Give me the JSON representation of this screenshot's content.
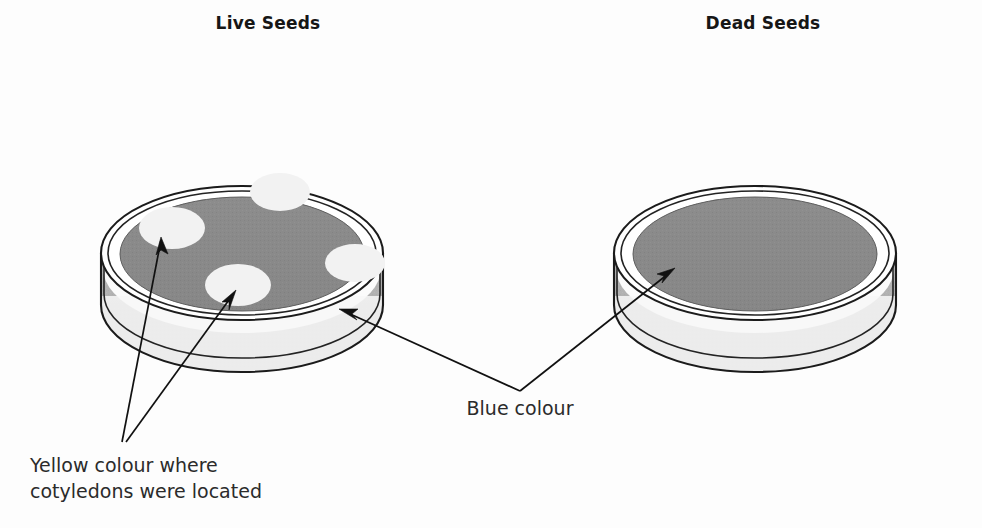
{
  "figure": {
    "background_color": "#fdfdfd"
  },
  "headings": [
    {
      "id": "live",
      "label": "Live Seeds",
      "x": 268,
      "y": 16
    },
    {
      "id": "dead",
      "label": "Dead Seeds",
      "x": 763,
      "y": 16
    }
  ],
  "callouts": [
    {
      "id": "yellow-callout",
      "lines": [
        "Yellow colour where",
        "cotyledons were located"
      ],
      "x": 30,
      "y": 472,
      "line_height": 26,
      "anchor": "start"
    },
    {
      "id": "blue-callout",
      "lines": [
        "Blue colour"
      ],
      "x": 520,
      "y": 415,
      "line_height": 26,
      "anchor": "middle"
    }
  ],
  "colors": {
    "medium_blue_gray": "#8a8a8a",
    "medium_blue_gray_shade": "#7e7e7e",
    "dish_wall_gray": "#b3b3b3",
    "dish_wall_gray_dark": "#a4a4a4",
    "dish_rim_white": "#fbfbfb",
    "cotyledon_yellow": "#f2f2f2",
    "cotyledon_yellow_edge": "#e8e8e8",
    "outline_black": "#1b1b1b",
    "text_dark": "#2b2b2b",
    "heading_dark": "#161616"
  },
  "dishes": [
    {
      "id": "live-seeds-dish",
      "name": "Live Seeds petri dish",
      "center_x": 242,
      "center_y": 253,
      "rim_rx": 141,
      "rim_ry": 67,
      "wall_height": 72,
      "medium_rx": 122,
      "medium_ry": 57,
      "medium_label": "blue colour medium",
      "spots": [
        {
          "id": "spot-top",
          "cx": 280,
          "cy": 192,
          "rx": 30,
          "ry": 19
        },
        {
          "id": "spot-left",
          "cx": 172,
          "cy": 228,
          "rx": 33,
          "ry": 21
        },
        {
          "id": "spot-center",
          "cx": 238,
          "cy": 285,
          "rx": 33,
          "ry": 21
        },
        {
          "id": "spot-right",
          "cx": 355,
          "cy": 263,
          "rx": 30,
          "ry": 19
        }
      ]
    },
    {
      "id": "dead-seeds-dish",
      "name": "Dead Seeds petri dish",
      "center_x": 755,
      "center_y": 253,
      "rim_rx": 141,
      "rim_ry": 67,
      "wall_height": 72,
      "medium_rx": 122,
      "medium_ry": 57,
      "medium_label": "blue colour medium",
      "spots": []
    }
  ],
  "arrows": [
    {
      "id": "arrow-yellow-to-left-spot",
      "from_label": "yellow-callout",
      "path": "M 122,442 L 158,249",
      "tip_x": 161,
      "tip_y": 237,
      "angle_deg": 281
    },
    {
      "id": "arrow-yellow-to-center-spot",
      "from_label": "yellow-callout",
      "path": "M 126,442 L 229,299",
      "tip_x": 236,
      "tip_y": 290,
      "angle_deg": 305
    },
    {
      "id": "arrow-blue-to-live-dish",
      "from_label": "blue-callout",
      "path": "M 520,391 L 353,316",
      "tip_x": 341,
      "tip_y": 310,
      "angle_deg": 204
    },
    {
      "id": "arrow-blue-to-dead-dish",
      "from_label": "blue-callout",
      "path": "M 520,391 L 664,277",
      "tip_x": 673,
      "tip_y": 269,
      "angle_deg": 322
    }
  ]
}
